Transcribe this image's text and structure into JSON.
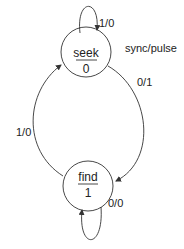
{
  "diagram": {
    "type": "state-machine",
    "title": "sync/pulse",
    "states": [
      {
        "id": "seek",
        "name": "seek",
        "output": "0"
      },
      {
        "id": "find",
        "name": "find",
        "output": "1"
      }
    ],
    "transitions": [
      {
        "from": "seek",
        "to": "seek",
        "label": "1/0"
      },
      {
        "from": "seek",
        "to": "find",
        "label": "0/1"
      },
      {
        "from": "find",
        "to": "seek",
        "label": "1/0"
      },
      {
        "from": "find",
        "to": "find",
        "label": "0/0"
      }
    ],
    "colors": {
      "stroke": "#333333",
      "background": "#ffffff",
      "text": "#222222"
    }
  }
}
